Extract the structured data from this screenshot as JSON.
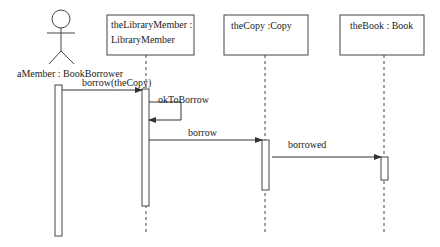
{
  "diagram": {
    "type": "UML sequence diagram",
    "actor": {
      "label": "aMember : BookBorrower"
    },
    "objects": [
      {
        "id": "libraryMember",
        "line1": "theLibraryMember :",
        "line2": "LibraryMember"
      },
      {
        "id": "copy",
        "line1": "theCopy :Copy"
      },
      {
        "id": "book",
        "line1": "theBook : Book"
      }
    ],
    "messages": [
      {
        "from": "aMember",
        "to": "theLibraryMember",
        "label": "borrow(theCopy)"
      },
      {
        "from": "theLibraryMember",
        "to": "theLibraryMember",
        "label": "okToBorrow"
      },
      {
        "from": "theLibraryMember",
        "to": "theCopy",
        "label": "borrow"
      },
      {
        "from": "theCopy",
        "to": "theBook",
        "label": "borrowed"
      }
    ],
    "colors": {
      "stroke": "#444444",
      "text": "#222222",
      "background": "#ffffff"
    }
  }
}
